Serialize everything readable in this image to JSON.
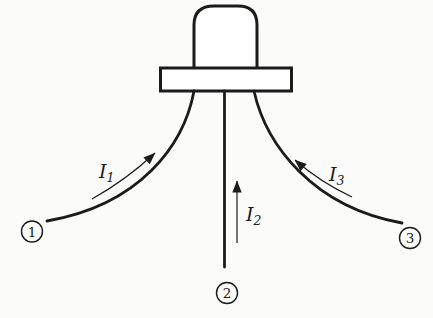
{
  "figure": {
    "current_labels": [
      {
        "symbol": "I",
        "subscript": "1"
      },
      {
        "symbol": "I",
        "subscript": "2"
      },
      {
        "symbol": "I",
        "subscript": "3"
      }
    ],
    "terminal_labels": [
      "1",
      "2",
      "3"
    ],
    "colors": {
      "line": "#1b1b1b",
      "paper": "#fbfbf9"
    }
  }
}
